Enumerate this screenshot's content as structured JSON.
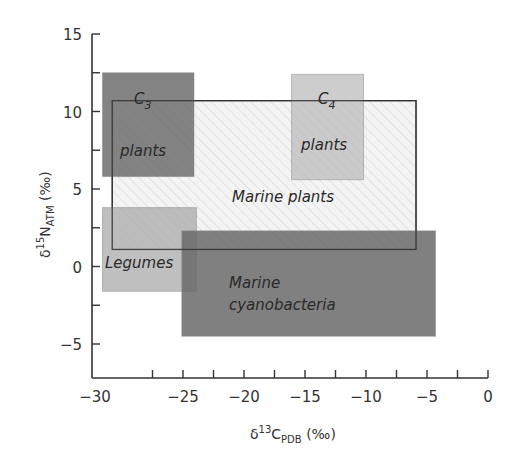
{
  "chart_data": {
    "type": "rectangle-regions",
    "title": "",
    "xlabel": "δ13C_PDB (‰)",
    "ylabel": "δ15N_ATM (‰)",
    "xlabel_parts": {
      "delta": "δ",
      "sup": "13",
      "main": "C",
      "sub": "PDB",
      "unit": " (‰)"
    },
    "ylabel_parts": {
      "delta": "δ",
      "sup": "15",
      "main": "N",
      "sub": "ATM",
      "unit": " (‰)"
    },
    "xlim": [
      -32.5,
      0
    ],
    "ylim": [
      -7.2,
      15
    ],
    "x_ticks": [
      -30,
      -25,
      -20,
      -15,
      -10,
      -5,
      0
    ],
    "x_tick_labels": [
      "−30",
      "−25",
      "−20",
      "−15",
      "−10",
      "−5",
      "0"
    ],
    "x_minor_step": 2.5,
    "y_ticks": [
      -5,
      0,
      5,
      10,
      15
    ],
    "y_tick_labels": [
      "−5",
      "0",
      "5",
      "10",
      "15"
    ],
    "y_minor_step": 2.5,
    "grid": false,
    "legend": "none",
    "regions": [
      {
        "name": "Marine plants",
        "label_lines": [
          "Marine plants"
        ],
        "x": [
          -30.8,
          -5.9
        ],
        "y": [
          1.1,
          10.7
        ],
        "fill": "#f2f2f2",
        "hatched": true,
        "outline": "#333333",
        "opacity": 1
      },
      {
        "name": "C3 plants",
        "label_lines": [
          "C3",
          "plants"
        ],
        "x": [
          -31.6,
          -24.1
        ],
        "y": [
          5.8,
          12.5
        ],
        "fill": "#6e6e6e",
        "opacity": 0.85
      },
      {
        "name": "C4 plants",
        "label_lines": [
          "C4",
          "plants"
        ],
        "x": [
          -16.1,
          -10.2
        ],
        "y": [
          5.6,
          12.4
        ],
        "fill": "#b8b8b8",
        "opacity": 0.7
      },
      {
        "name": "Legumes",
        "label_lines": [
          "Legumes"
        ],
        "x": [
          -31.6,
          -23.9
        ],
        "y": [
          -1.6,
          3.8
        ],
        "fill": "#aaaaaa",
        "opacity": 0.75
      },
      {
        "name": "Marine cyanobacteria",
        "label_lines": [
          "Marine",
          "cyanobacteria"
        ],
        "x": [
          -25.1,
          -4.3
        ],
        "y": [
          -4.5,
          2.3
        ],
        "fill": "#6a6a6a",
        "opacity": 0.85
      }
    ]
  },
  "labels": {
    "c3_main": "C",
    "c3_sub": "3",
    "c3_line2": "plants",
    "c4_main": "C",
    "c4_sub": "4",
    "c4_line2": "plants",
    "marine_plants": "Marine plants",
    "legumes": "Legumes",
    "cyano_line1": "Marine",
    "cyano_line2": "cyanobacteria"
  },
  "colors": {
    "axis": "#333333",
    "hatch": "#c8c8c8"
  }
}
